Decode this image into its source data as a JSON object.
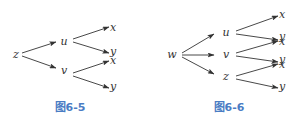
{
  "figures": [
    {
      "caption": "图6-5",
      "root": "z",
      "nodes": [
        {
          "id": "z",
          "label": "z",
          "x": 16,
          "y": 58
        },
        {
          "id": "u",
          "label": "u",
          "x": 64,
          "y": 45
        },
        {
          "id": "v",
          "label": "v",
          "x": 64,
          "y": 74
        },
        {
          "id": "ux",
          "label": "x",
          "x": 113,
          "y": 31
        },
        {
          "id": "uy",
          "label": "y",
          "x": 113,
          "y": 55
        },
        {
          "id": "vx",
          "label": "x",
          "x": 113,
          "y": 64
        },
        {
          "id": "vy",
          "label": "y",
          "x": 113,
          "y": 90
        }
      ],
      "edges": [
        {
          "from": "z",
          "to": "u",
          "x1": 22,
          "y1": 53,
          "x2": 56,
          "y2": 42
        },
        {
          "from": "z",
          "to": "v",
          "x1": 22,
          "y1": 56,
          "x2": 56,
          "y2": 68
        },
        {
          "from": "u",
          "to": "x",
          "x1": 73,
          "y1": 39,
          "x2": 109,
          "y2": 27
        },
        {
          "from": "u",
          "to": "y",
          "x1": 73,
          "y1": 42,
          "x2": 109,
          "y2": 53
        },
        {
          "from": "v",
          "to": "x",
          "x1": 73,
          "y1": 73,
          "x2": 109,
          "y2": 61
        },
        {
          "from": "v",
          "to": "y",
          "x1": 73,
          "y1": 76,
          "x2": 109,
          "y2": 88
        }
      ]
    },
    {
      "caption": "图6-6",
      "root": "w",
      "nodes": [
        {
          "id": "w",
          "label": "w",
          "x": 172,
          "y": 58
        },
        {
          "id": "u",
          "label": "u",
          "x": 226,
          "y": 36
        },
        {
          "id": "v",
          "label": "v",
          "x": 226,
          "y": 58
        },
        {
          "id": "z",
          "label": "z",
          "x": 226,
          "y": 80
        },
        {
          "id": "ux",
          "label": "x",
          "x": 282,
          "y": 18
        },
        {
          "id": "uy",
          "label": "y",
          "x": 282,
          "y": 40
        },
        {
          "id": "vx",
          "label": "x",
          "x": 282,
          "y": 45
        },
        {
          "id": "vy",
          "label": "y",
          "x": 282,
          "y": 63
        },
        {
          "id": "zx",
          "label": "x",
          "x": 282,
          "y": 68
        },
        {
          "id": "zy",
          "label": "y",
          "x": 282,
          "y": 90
        }
      ],
      "edges": [
        {
          "from": "w",
          "to": "u",
          "x1": 182,
          "y1": 53,
          "x2": 214,
          "y2": 34
        },
        {
          "from": "w",
          "to": "v",
          "x1": 182,
          "y1": 55,
          "x2": 214,
          "y2": 55
        },
        {
          "from": "w",
          "to": "z",
          "x1": 182,
          "y1": 57,
          "x2": 214,
          "y2": 74
        },
        {
          "from": "u",
          "to": "x",
          "x1": 236,
          "y1": 31,
          "x2": 278,
          "y2": 16
        },
        {
          "from": "u",
          "to": "y",
          "x1": 236,
          "y1": 34,
          "x2": 278,
          "y2": 40
        },
        {
          "from": "v",
          "to": "x",
          "x1": 236,
          "y1": 53,
          "x2": 278,
          "y2": 41
        },
        {
          "from": "v",
          "to": "y",
          "x1": 236,
          "y1": 56,
          "x2": 278,
          "y2": 62
        },
        {
          "from": "z",
          "to": "x",
          "x1": 236,
          "y1": 76,
          "x2": 278,
          "y2": 64
        },
        {
          "from": "z",
          "to": "y",
          "x1": 236,
          "y1": 79,
          "x2": 278,
          "y2": 88
        }
      ]
    }
  ],
  "captions": {
    "left": "图6-5",
    "right": "图6-6"
  },
  "colors": {
    "line": "#333333",
    "text": "#333333",
    "caption": "#4a7cc4"
  }
}
